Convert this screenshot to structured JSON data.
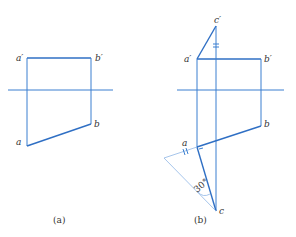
{
  "figure": {
    "panels": [
      {
        "id": "a",
        "caption": "(a)",
        "labels": {
          "a_prime": "a′",
          "b_prime": "b′",
          "a": "a",
          "b": "b"
        }
      },
      {
        "id": "b",
        "caption": "(b)",
        "labels": {
          "c_prime": "c′",
          "a_prime": "a′",
          "b_prime": "b′",
          "a": "a",
          "b": "b",
          "c": "c"
        },
        "angle_label": "30°"
      }
    ],
    "colors": {
      "line": "#3a7fd0",
      "text": "#333333"
    }
  }
}
